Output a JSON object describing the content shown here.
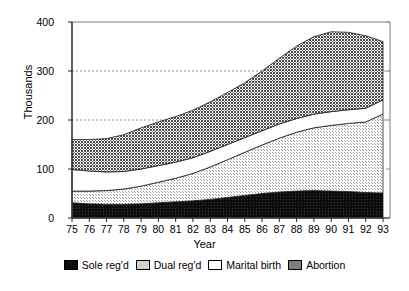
{
  "chart_data": {
    "type": "area",
    "title": "",
    "subtitle": "",
    "xlabel": "Year",
    "ylabel": "Thousands",
    "stacked": true,
    "grid": true,
    "grid_lines": [
      200,
      300
    ],
    "legend_position": "bottom",
    "xlim": [
      75,
      93
    ],
    "ylim": [
      0,
      400
    ],
    "yticks": [
      0,
      100,
      200,
      300,
      400
    ],
    "categories": [
      "75",
      "76",
      "77",
      "78",
      "79",
      "80",
      "81",
      "82",
      "83",
      "84",
      "85",
      "86",
      "87",
      "88",
      "89",
      "90",
      "91",
      "92",
      "93"
    ],
    "x": [
      75,
      76,
      77,
      78,
      79,
      80,
      81,
      82,
      83,
      84,
      85,
      86,
      87,
      88,
      89,
      90,
      91,
      92,
      93
    ],
    "series": [
      {
        "name": "Sole reg'd",
        "color": "#111111",
        "pattern": "solid-black",
        "values": [
          31,
          29,
          28,
          28,
          29,
          31,
          33,
          35,
          38,
          42,
          46,
          50,
          53,
          55,
          56,
          55,
          54,
          52,
          51
        ]
      },
      {
        "name": "Dual reg'd",
        "color": "#cccccc",
        "pattern": "light-stipple",
        "values": [
          24,
          26,
          28,
          31,
          36,
          42,
          48,
          56,
          66,
          77,
          88,
          99,
          110,
          120,
          128,
          134,
          139,
          144,
          161
        ]
      },
      {
        "name": "Marital birth",
        "color": "#ffffff",
        "pattern": "white",
        "values": [
          44,
          41,
          38,
          36,
          35,
          34,
          33,
          32,
          32,
          31,
          30,
          29,
          29,
          28,
          28,
          28,
          28,
          28,
          29
        ]
      },
      {
        "name": "Abortion",
        "color": "#8a8a8a",
        "pattern": "dark-stipple",
        "values": [
          61,
          64,
          68,
          75,
          84,
          89,
          93,
          97,
          101,
          106,
          112,
          122,
          134,
          148,
          158,
          163,
          158,
          148,
          119
        ]
      }
    ],
    "totals": [
      160,
      160,
      162,
      170,
      184,
      196,
      207,
      220,
      237,
      256,
      276,
      300,
      326,
      351,
      370,
      380,
      379,
      372,
      360
    ]
  },
  "axes": {
    "ylabel": "Thousands",
    "xlabel": "Year",
    "yticks": [
      "0",
      "100",
      "200",
      "300",
      "400"
    ],
    "xticks": [
      "75",
      "76",
      "77",
      "78",
      "79",
      "80",
      "81",
      "82",
      "83",
      "84",
      "85",
      "86",
      "87",
      "88",
      "89",
      "90",
      "91",
      "92",
      "93"
    ]
  },
  "legend": {
    "items": [
      {
        "label": "Sole reg'd",
        "color": "#111111"
      },
      {
        "label": "Dual reg'd",
        "color": "#cccccc"
      },
      {
        "label": "Marital birth",
        "color": "#ffffff"
      },
      {
        "label": "Abortion",
        "color": "#8a8a8a"
      }
    ]
  }
}
